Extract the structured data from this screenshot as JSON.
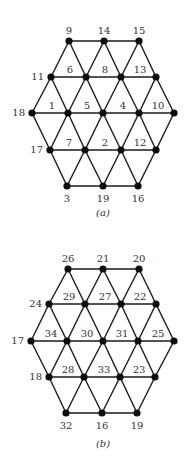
{
  "figures": [
    {
      "id": "a",
      "caption": "(a)",
      "caption_pos": [
        103,
        216
      ],
      "rows": [
        {
          "y": 41,
          "nodes": [
            {
              "label": "9",
              "x": 69
            },
            {
              "label": "14",
              "x": 104
            },
            {
              "label": "15",
              "x": 139
            }
          ]
        },
        {
          "y": 77,
          "nodes": [
            {
              "label": "11",
              "x": 51
            },
            {
              "label": "6",
              "x": 86
            },
            {
              "label": "8",
              "x": 121
            },
            {
              "label": "13",
              "x": 156
            }
          ]
        },
        {
          "y": 113,
          "nodes": [
            {
              "label": "18",
              "x": 32
            },
            {
              "label": "1",
              "x": 68
            },
            {
              "label": "5",
              "x": 103
            },
            {
              "label": "4",
              "x": 139
            },
            {
              "label": "10",
              "x": 174
            }
          ]
        },
        {
          "y": 150,
          "nodes": [
            {
              "label": "17",
              "x": 50
            },
            {
              "label": "7",
              "x": 85
            },
            {
              "label": "2",
              "x": 121
            },
            {
              "label": "12",
              "x": 156
            }
          ]
        },
        {
          "y": 186,
          "nodes": [
            {
              "label": "3",
              "x": 67
            },
            {
              "label": "19",
              "x": 103
            },
            {
              "label": "16",
              "x": 138
            }
          ]
        }
      ]
    },
    {
      "id": "b",
      "caption": "(b)",
      "caption_pos": [
        103,
        447
      ],
      "rows": [
        {
          "y": 269,
          "nodes": [
            {
              "label": "26",
              "x": 68
            },
            {
              "label": "21",
              "x": 103
            },
            {
              "label": "20",
              "x": 139
            }
          ]
        },
        {
          "y": 304,
          "nodes": [
            {
              "label": "24",
              "x": 49
            },
            {
              "label": "29",
              "x": 85
            },
            {
              "label": "27",
              "x": 121
            },
            {
              "label": "22",
              "x": 156
            }
          ]
        },
        {
          "y": 341,
          "nodes": [
            {
              "label": "17",
              "x": 31
            },
            {
              "label": "34",
              "x": 67
            },
            {
              "label": "30",
              "x": 103
            },
            {
              "label": "31",
              "x": 138
            },
            {
              "label": "25",
              "x": 174
            }
          ]
        },
        {
          "y": 377,
          "nodes": [
            {
              "label": "18",
              "x": 49
            },
            {
              "label": "28",
              "x": 84
            },
            {
              "label": "33",
              "x": 120
            },
            {
              "label": "23",
              "x": 155
            }
          ]
        },
        {
          "y": 413,
          "nodes": [
            {
              "label": "32",
              "x": 66
            },
            {
              "label": "16",
              "x": 102
            },
            {
              "label": "19",
              "x": 137
            }
          ]
        }
      ]
    }
  ],
  "colors": {
    "edge": "#1a1a1a",
    "node": "#0d0d0d",
    "label": "#333333",
    "background": "#ffffff"
  }
}
